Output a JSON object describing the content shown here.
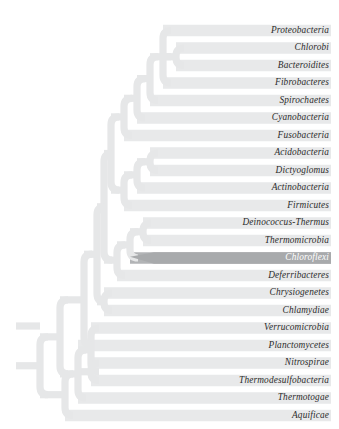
{
  "figure": {
    "type": "phylogenetic-tree-cladogram",
    "title": "",
    "background_color": "#ffffff",
    "branch_color": "#e6e7e8",
    "branch_highlight_color": "#a8aaac",
    "band_color": "#e8e9ea",
    "band_highlight_color": "#b2b4b6",
    "label_color": "#2b2b2b",
    "label_highlight_color": "#ffffff",
    "root_x": 16,
    "band_right_x": 331,
    "row_height": 17.5,
    "first_row_center_y": 30.5
  },
  "taxa": [
    {
      "label": "Proteobacteria",
      "row": 0,
      "center_y": 30.5,
      "branch_x": 163,
      "highlighted": false
    },
    {
      "label": "Chlorobi",
      "row": 1,
      "center_y": 48.0,
      "branch_x": 176,
      "highlighted": false
    },
    {
      "label": "Bacteroidites",
      "row": 2,
      "center_y": 65.5,
      "branch_x": 176,
      "highlighted": false
    },
    {
      "label": "Fibrobacteres",
      "row": 3,
      "center_y": 83.0,
      "branch_x": 163,
      "highlighted": false
    },
    {
      "label": "Spirochaetes",
      "row": 4,
      "center_y": 100.5,
      "branch_x": 150,
      "highlighted": false
    },
    {
      "label": "Cyanobacteria",
      "row": 5,
      "center_y": 118.0,
      "branch_x": 137,
      "highlighted": false
    },
    {
      "label": "Fusobacteria",
      "row": 6,
      "center_y": 135.5,
      "branch_x": 124,
      "highlighted": false
    },
    {
      "label": "Acidobacteria",
      "row": 7,
      "center_y": 153.0,
      "branch_x": 150,
      "highlighted": false
    },
    {
      "label": "Dictyoglomus",
      "row": 8,
      "center_y": 170.5,
      "branch_x": 150,
      "highlighted": false
    },
    {
      "label": "Actinobacteria",
      "row": 9,
      "center_y": 188.0,
      "branch_x": 137,
      "highlighted": false
    },
    {
      "label": "Firmicutes",
      "row": 10,
      "center_y": 205.5,
      "branch_x": 124,
      "highlighted": false
    },
    {
      "label": "Deinococcus-Thermus",
      "row": 11,
      "center_y": 223.0,
      "branch_x": 143,
      "highlighted": false
    },
    {
      "label": "Thermomicrobia",
      "row": 12,
      "center_y": 240.5,
      "branch_x": 143,
      "highlighted": false
    },
    {
      "label": "Chloroflexi",
      "row": 13,
      "center_y": 258.0,
      "branch_x": 130,
      "highlighted": true
    },
    {
      "label": "Deferribacteres",
      "row": 14,
      "center_y": 275.5,
      "branch_x": 117,
      "highlighted": false
    },
    {
      "label": "Chrysiogenetes",
      "row": 15,
      "center_y": 293.0,
      "branch_x": 104,
      "highlighted": false
    },
    {
      "label": "Chlamydiae",
      "row": 16,
      "center_y": 310.5,
      "branch_x": 104,
      "highlighted": false
    },
    {
      "label": "Verrucomicrobia",
      "row": 17,
      "center_y": 328.0,
      "branch_x": 91,
      "highlighted": false
    },
    {
      "label": "Planctomycetes",
      "row": 18,
      "center_y": 345.5,
      "branch_x": 78,
      "highlighted": false
    },
    {
      "label": "Nitrospirae",
      "row": 19,
      "center_y": 363.0,
      "branch_x": 91,
      "highlighted": false
    },
    {
      "label": "Thermodesulfobacteria",
      "row": 20,
      "center_y": 380.5,
      "branch_x": 91,
      "highlighted": false
    },
    {
      "label": "Thermotogae",
      "row": 21,
      "center_y": 398.0,
      "branch_x": 78,
      "highlighted": false
    },
    {
      "label": "Aquificae",
      "row": 22,
      "center_y": 415.5,
      "branch_x": 65,
      "highlighted": false
    }
  ]
}
